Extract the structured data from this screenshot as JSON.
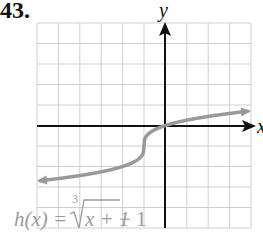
{
  "problem": {
    "number": "43."
  },
  "graph": {
    "x_axis_label": "x",
    "y_axis_label": "y",
    "formula": {
      "lhs": "h(x) = ",
      "index": "3",
      "radicand": "x + 1",
      "tail": " − 1"
    },
    "colors": {
      "grid": "#cfcfcf",
      "axes": "#111111",
      "curve": "#999999",
      "formula": "#9a9a9a"
    }
  },
  "chart_data": {
    "type": "line",
    "xlabel": "x",
    "ylabel": "y",
    "xlim": [
      -6,
      4
    ],
    "ylim": [
      -5,
      5
    ],
    "grid": true,
    "series": [
      {
        "name": "h(x) = ∛(x+1) − 1",
        "x": [
          -6,
          -5,
          -4,
          -3,
          -2,
          -1.5,
          -1.1,
          -1,
          -0.9,
          -0.5,
          0,
          1,
          2,
          3,
          4
        ],
        "y": [
          -2.71,
          -2.59,
          -2.44,
          -2.26,
          -2.0,
          -1.79,
          -1.46,
          -1.0,
          -0.54,
          -0.21,
          0.0,
          0.26,
          0.44,
          0.59,
          0.71
        ]
      }
    ],
    "annotations": [
      "arrow at left end (x=-6)",
      "arrow at right end (x=4)"
    ]
  }
}
